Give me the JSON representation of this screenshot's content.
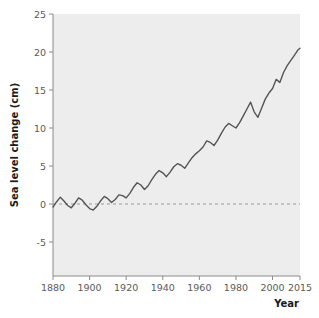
{
  "chart_data": {
    "type": "line",
    "title": "",
    "xlabel": "Year",
    "ylabel": "Sea level change (cm)",
    "xlim": [
      1880,
      2015
    ],
    "ylim": [
      -7.5,
      25
    ],
    "xticks": [
      1880,
      1900,
      1920,
      1940,
      1960,
      1980,
      2000,
      2015
    ],
    "xticklabels": [
      "1880",
      "1900",
      "1920",
      "1940",
      "1960",
      "1980",
      "2000",
      "2015"
    ],
    "yticks": [
      -5,
      0,
      5,
      10,
      15,
      20,
      25
    ],
    "yticklabels": [
      "-5",
      "0",
      "5",
      "10",
      "15",
      "20",
      "25"
    ],
    "grid": false,
    "legend": null,
    "annotations": [
      {
        "name": "zero-reference-line",
        "type": "hline",
        "y": 0,
        "style": "dashed",
        "color": "#999999"
      }
    ],
    "panel_background": "#ededed",
    "line_color": "#555555",
    "series": [
      {
        "name": "Global mean sea level change",
        "x": [
          1880,
          1882,
          1884,
          1886,
          1888,
          1890,
          1892,
          1894,
          1896,
          1898,
          1900,
          1902,
          1904,
          1906,
          1908,
          1910,
          1912,
          1914,
          1916,
          1918,
          1920,
          1922,
          1924,
          1926,
          1928,
          1930,
          1932,
          1934,
          1936,
          1938,
          1940,
          1942,
          1944,
          1946,
          1948,
          1950,
          1952,
          1954,
          1956,
          1958,
          1960,
          1962,
          1964,
          1966,
          1968,
          1970,
          1972,
          1974,
          1976,
          1978,
          1980,
          1982,
          1984,
          1986,
          1988,
          1990,
          1992,
          1994,
          1996,
          1998,
          2000,
          2002,
          2004,
          2006,
          2008,
          2010,
          2012,
          2014,
          2015
        ],
        "values": [
          -0.4,
          0.3,
          0.9,
          0.4,
          -0.2,
          -0.5,
          0.1,
          0.8,
          0.5,
          -0.1,
          -0.6,
          -0.8,
          -0.3,
          0.4,
          1.0,
          0.7,
          0.2,
          0.6,
          1.2,
          1.1,
          0.8,
          1.4,
          2.2,
          2.8,
          2.5,
          1.9,
          2.4,
          3.2,
          3.9,
          4.4,
          4.1,
          3.6,
          4.2,
          4.9,
          5.3,
          5.1,
          4.7,
          5.4,
          6.1,
          6.6,
          7.0,
          7.5,
          8.3,
          8.1,
          7.7,
          8.4,
          9.3,
          10.1,
          10.6,
          10.3,
          10.0,
          10.7,
          11.6,
          12.5,
          13.4,
          12.1,
          11.4,
          12.6,
          13.8,
          14.6,
          15.2,
          16.4,
          16.0,
          17.3,
          18.2,
          18.9,
          19.6,
          20.3,
          20.5
        ]
      }
    ]
  }
}
